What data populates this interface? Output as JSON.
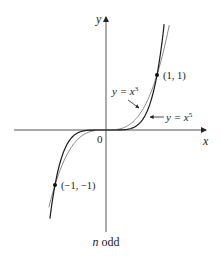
{
  "chart_data": {
    "type": "line",
    "title": "",
    "caption": "n odd",
    "xlabel": "x",
    "ylabel": "y",
    "origin_label": "0",
    "grid": false,
    "legend": "none (inline labels)",
    "series": [
      {
        "name": "y = x^3",
        "label_prefix": "y = x",
        "exponent": "3",
        "color": "#8a8a8a",
        "x": [
          -1.12,
          -1,
          -0.5,
          0,
          0.5,
          1,
          1.24
        ],
        "y": [
          -1.4,
          -1,
          -0.125,
          0,
          0.125,
          1,
          1.91
        ]
      },
      {
        "name": "y = x^5",
        "label_prefix": "y = x",
        "exponent": "5",
        "color": "#1a1a1a",
        "x": [
          -1.1,
          -1,
          -0.5,
          0,
          0.5,
          1,
          1.14
        ],
        "y": [
          -1.61,
          -1,
          -0.03125,
          0,
          0.03125,
          1,
          1.93
        ]
      }
    ],
    "points": [
      {
        "label": "(1, 1)",
        "x": 1,
        "y": 1
      },
      {
        "label": "(−1, −1)",
        "x": -1,
        "y": -1
      }
    ],
    "axis_color": "#555555"
  }
}
